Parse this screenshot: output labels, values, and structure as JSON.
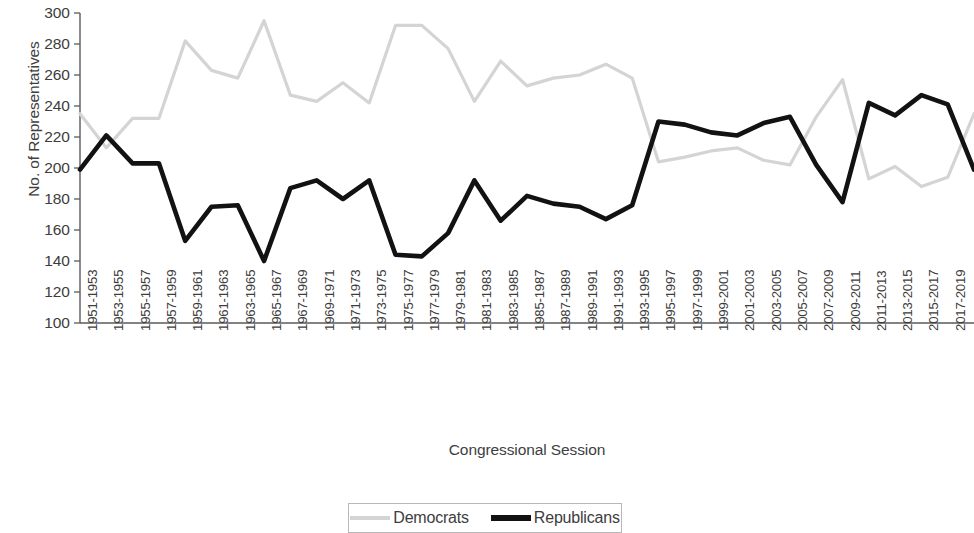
{
  "chart_data": {
    "type": "line",
    "title": "",
    "xlabel": "Congressional Session",
    "ylabel": "No. of Representatives",
    "ylim": [
      100,
      300
    ],
    "ytick_step": 20,
    "yticks": [
      300,
      280,
      260,
      240,
      220,
      200,
      180,
      160,
      140,
      120,
      100
    ],
    "grid": false,
    "legend_position": "bottom",
    "categories": [
      "1951-1953",
      "1953-1955",
      "1955-1957",
      "1957-1959",
      "1959-1961",
      "1961-1963",
      "1963-1965",
      "1965-1967",
      "1967-1969",
      "1969-1971",
      "1971-1973",
      "1973-1975",
      "1975-1977",
      "1977-1979",
      "1979-1981",
      "1981-1983",
      "1983-1985",
      "1985-1987",
      "1987-1989",
      "1989-1991",
      "1991-1993",
      "1993-1995",
      "1995-1997",
      "1997-1999",
      "1999-2001",
      "2001-2003",
      "2003-2005",
      "2005-2007",
      "2007-2009",
      "2009-2011",
      "2011-2013",
      "2013-2015",
      "2015-2017",
      "2017-2019",
      "2019-2021"
    ],
    "series": [
      {
        "name": "Democrats",
        "color": "#d4d4d4",
        "values": [
          235,
          213,
          232,
          232,
          282,
          263,
          258,
          295,
          247,
          243,
          255,
          242,
          292,
          292,
          277,
          243,
          269,
          253,
          258,
          260,
          267,
          258,
          204,
          207,
          211,
          213,
          205,
          202,
          233,
          257,
          193,
          201,
          188,
          194,
          235
        ]
      },
      {
        "name": "Republicans",
        "color": "#121212",
        "values": [
          199,
          221,
          203,
          203,
          153,
          175,
          176,
          140,
          187,
          192,
          180,
          192,
          144,
          143,
          158,
          192,
          166,
          182,
          177,
          175,
          167,
          176,
          230,
          228,
          223,
          221,
          229,
          233,
          202,
          178,
          242,
          234,
          247,
          241,
          199
        ]
      }
    ]
  },
  "legend": {
    "entries": [
      {
        "label": "Democrats",
        "swatch": "dem-line-swatch"
      },
      {
        "label": "Republicans",
        "swatch": "rep-line-swatch"
      }
    ]
  }
}
